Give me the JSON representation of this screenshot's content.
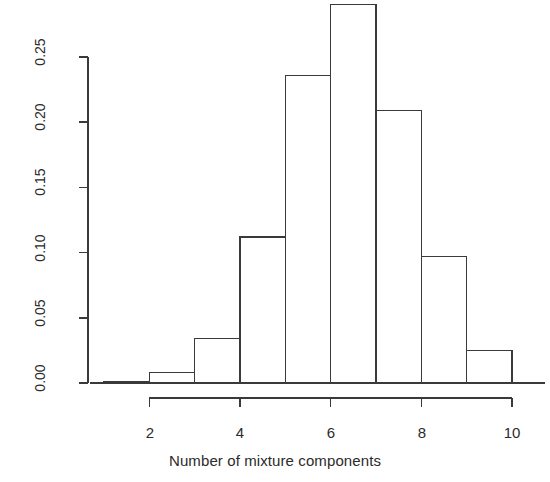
{
  "chart_data": {
    "type": "bar",
    "chart_subtype": "histogram",
    "title": "",
    "xlabel": "Number of mixture components",
    "ylabel": "Frequency",
    "categories": [
      "1-2",
      "2-3",
      "3-4",
      "4-5",
      "5-6",
      "6-7",
      "7-8",
      "8-9",
      "9-10"
    ],
    "bin_edges": [
      1,
      2,
      3,
      4,
      5,
      6,
      7,
      8,
      9,
      10
    ],
    "values": [
      0.001,
      0.008,
      0.034,
      0.112,
      0.236,
      0.29,
      0.209,
      0.097,
      0.025
    ],
    "bin_centers": [
      1.5,
      2.5,
      3.5,
      4.5,
      5.5,
      6.5,
      7.5,
      8.5,
      9.5
    ],
    "xlim": [
      1,
      10
    ],
    "ylim": [
      0.0,
      0.29
    ],
    "xticks": [
      2,
      4,
      6,
      8,
      10
    ],
    "xtick_labels": [
      "2",
      "4",
      "6",
      "8",
      "10"
    ],
    "yticks": [
      0.0,
      0.05,
      0.1,
      0.15,
      0.2,
      0.25
    ],
    "ytick_labels": [
      "0.00",
      "0.05",
      "0.10",
      "0.15",
      "0.20",
      "0.25"
    ],
    "grid": false,
    "legend": null,
    "bar_fill_color": "#ffffff",
    "bar_edge_color": "#3a3a3a",
    "axis_color": "#3a3a3a"
  }
}
